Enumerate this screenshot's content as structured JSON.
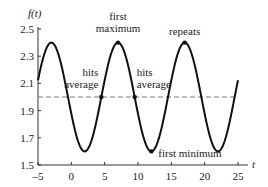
{
  "chart_data": {
    "type": "line",
    "title": "",
    "xlabel": "t",
    "ylabel": "f(t)",
    "xlim": [
      -5,
      25
    ],
    "ylim": [
      1.5,
      2.5
    ],
    "x_ticks": [
      -5,
      0,
      5,
      10,
      15,
      20,
      25
    ],
    "x_tick_labels": [
      "–5",
      "0",
      "5",
      "10",
      "15",
      "20",
      "25"
    ],
    "y_ticks": [
      1.5,
      1.7,
      1.9,
      2.1,
      2.3,
      2.5
    ],
    "y_tick_labels": [
      "1.5",
      "1.7",
      "1.9",
      "2.1",
      "2.3",
      "2.5"
    ],
    "grid": false,
    "series": [
      {
        "name": "f(t)",
        "style": "solid",
        "color": "#111111",
        "function": "2 + 0.4*sin(2*pi*(t-4.5)/10)",
        "x": [
          -5,
          -3,
          -0.5,
          2,
          4.5,
          7,
          9.5,
          12,
          14.5,
          17,
          19.5,
          22,
          24.5,
          25
        ],
        "values": [
          2.12,
          2.4,
          2.0,
          1.6,
          2.0,
          2.4,
          2.0,
          1.6,
          2.0,
          2.4,
          2.0,
          1.6,
          2.0,
          2.12
        ]
      },
      {
        "name": "average",
        "style": "dashed",
        "color": "#777777",
        "x": [
          -5,
          25
        ],
        "values": [
          2.0,
          2.0
        ]
      }
    ],
    "points": [
      {
        "t": 4.5,
        "value": 2.0,
        "label": "hits average"
      },
      {
        "t": 7,
        "value": 2.4,
        "label": "first maximum"
      },
      {
        "t": 9.5,
        "value": 2.0,
        "label": "hits average"
      },
      {
        "t": 12,
        "value": 1.6,
        "label": "first minimum"
      },
      {
        "t": 17,
        "value": 2.4,
        "label": "repeats"
      }
    ],
    "annotations": [
      {
        "text": [
          "first",
          "maximum"
        ],
        "t": 7,
        "value": 2.4
      },
      {
        "text": [
          "repeats"
        ],
        "t": 17,
        "value": 2.4
      },
      {
        "text": [
          "hits",
          "average"
        ],
        "t": 4.5,
        "value": 2.0
      },
      {
        "text": [
          "hits",
          "average"
        ],
        "t": 9.5,
        "value": 2.0
      },
      {
        "text": [
          "first minimum"
        ],
        "t": 12,
        "value": 1.6
      }
    ],
    "legend": null
  }
}
